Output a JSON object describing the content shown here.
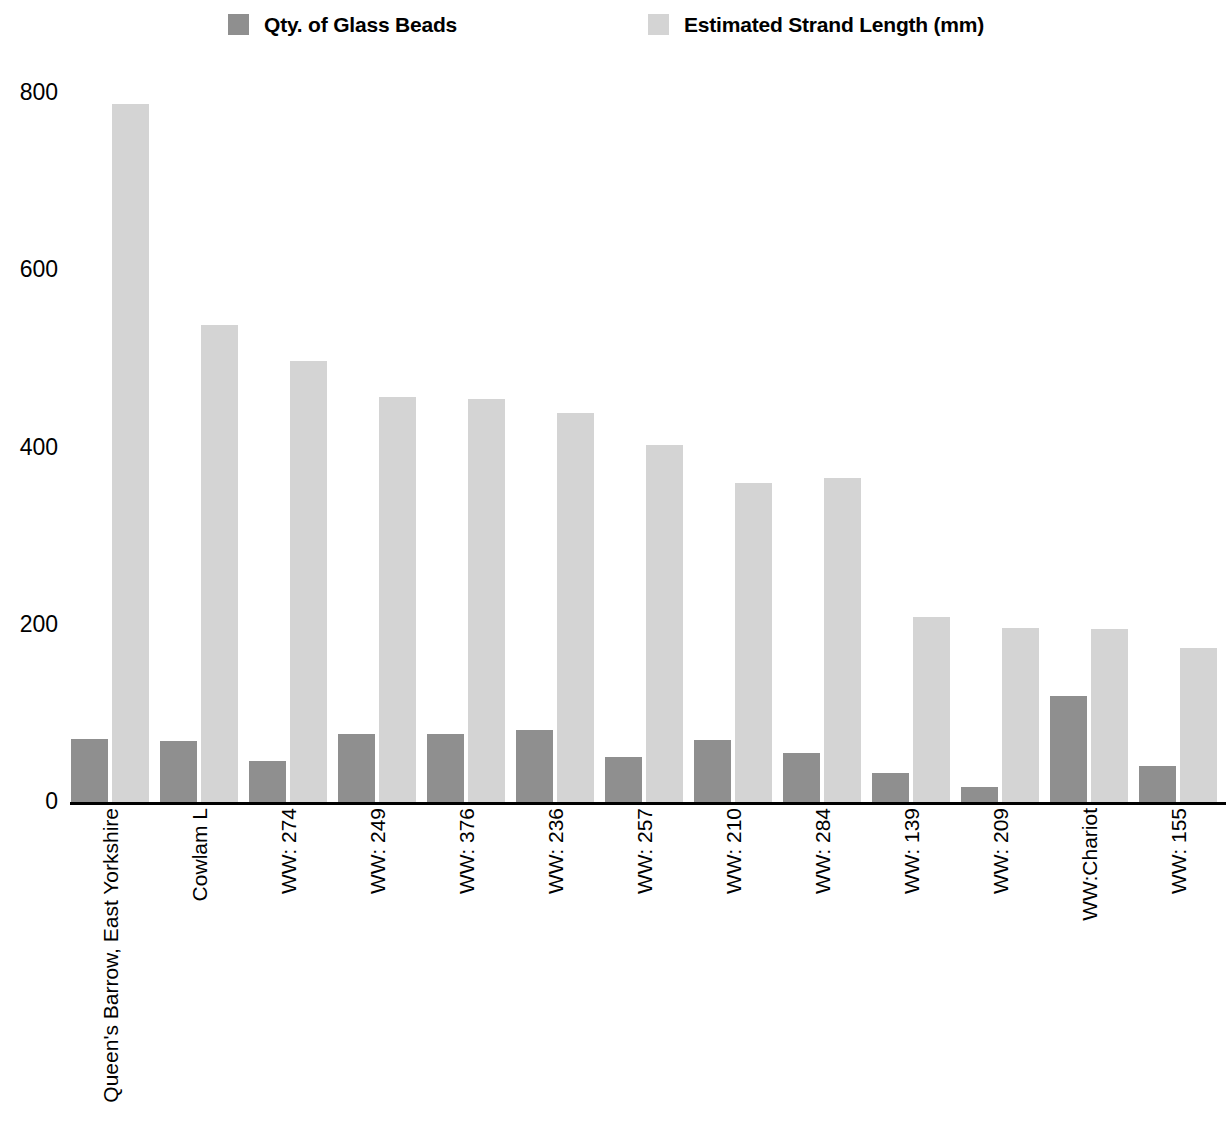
{
  "legend": {
    "items": [
      {
        "label": "Qty. of Glass Beads",
        "color": "#8f8f8f",
        "swatch_name": "legend-swatch-qty"
      },
      {
        "label": "Estimated Strand Length (mm)",
        "color": "#d4d4d4",
        "swatch_name": "legend-swatch-length"
      }
    ]
  },
  "axis": {
    "y_ticks": [
      "800",
      "600",
      "400",
      "200",
      "0"
    ],
    "y_tick_values": [
      800,
      600,
      400,
      200,
      0
    ]
  },
  "chart_data": {
    "type": "bar",
    "title": "",
    "subtitle": "",
    "xlabel": "",
    "ylabel": "",
    "ylim": [
      0,
      800
    ],
    "grid": false,
    "legend_position": "top",
    "orientation": "vertical",
    "grouping": "grouped",
    "categories": [
      "Queen's Barrow, East Yorkshire",
      "Cowlam L",
      "WW: 274",
      "WW: 249",
      "WW: 376",
      "WW: 236",
      "WW: 257",
      "WW: 210",
      "WW: 284",
      "WW: 139",
      "WW: 209",
      "WW:Chariot",
      "WW: 155"
    ],
    "series": [
      {
        "name": "Qty. of Glass Beads",
        "color": "#8f8f8f",
        "values": [
          71,
          69,
          46,
          77,
          77,
          81,
          51,
          70,
          55,
          33,
          17,
          120,
          41
        ]
      },
      {
        "name": "Estimated Strand Length (mm)",
        "color": "#d4d4d4",
        "values": [
          788,
          538,
          498,
          457,
          455,
          439,
          403,
          360,
          366,
          209,
          196,
          195,
          174
        ]
      }
    ],
    "ticks": [
      800,
      600,
      400,
      200,
      0
    ]
  }
}
